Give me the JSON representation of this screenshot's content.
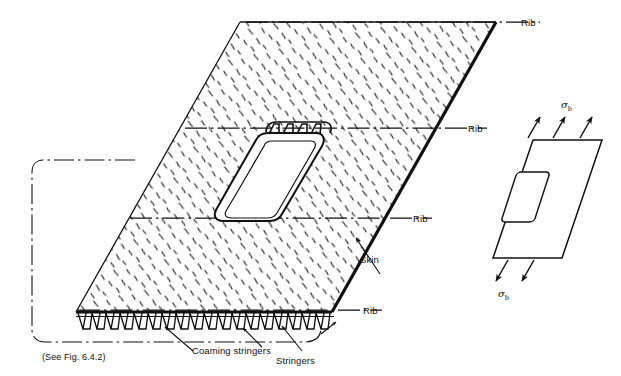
{
  "figure": {
    "background": "#ffffff",
    "ink": "#111111"
  },
  "labels": {
    "rib_1": "Rib",
    "rib_2": "Rib",
    "rib_3": "Rib",
    "rib_4": "Rib",
    "skin": "Skin",
    "coaming_stringers": "Coaming stringers",
    "stringers": "Stringers",
    "see_fig": "(See Fig. 6.4.2)"
  },
  "stress": {
    "top_symbol": "σ",
    "top_subscript": "b",
    "bottom_symbol": "σ",
    "bottom_subscript": "b",
    "top_arrow_count": 3,
    "bottom_arrow_count": 3,
    "top_arrow_direction": "up-right",
    "bottom_arrow_direction": "down-left"
  },
  "panel": {
    "name": "main-stiffened-panel",
    "shape": "parallelogram",
    "hatching": "random-dash-speckle",
    "rib_lines": 4,
    "rib_line_style": "dash-dot",
    "stringer_count": 18,
    "stringer_profile": "hat-section",
    "cutout": {
      "name": "central-cutout",
      "shape": "rounded-rectangle",
      "coaming_stringer_count": 4
    }
  },
  "inset": {
    "name": "idealised-panel-inset",
    "shape": "parallelogram",
    "cutout_shape": "rounded-rectangle",
    "description": "idealised sheet with central cutout under uniform tension"
  },
  "icons": {
    "arrow_up_right": "arrow-up-right-icon",
    "arrow_down_left": "arrow-down-left-icon",
    "leader_arrow": "leader-arrow-icon",
    "brace": "curly-brace-icon"
  }
}
